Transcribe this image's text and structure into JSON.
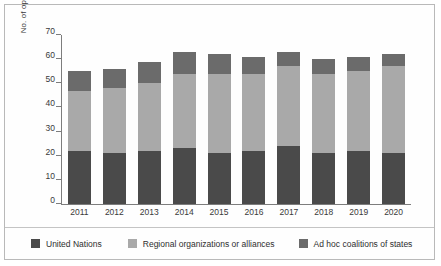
{
  "chart_data": {
    "type": "bar",
    "stacked": true,
    "title": "",
    "xlabel": "",
    "ylabel": "No. of operations",
    "ylim": [
      0,
      70
    ],
    "ytick_step": 10,
    "yticks": [
      0,
      10,
      20,
      30,
      40,
      50,
      60,
      70
    ],
    "grid": false,
    "legend_position": "bottom",
    "categories": [
      "2011",
      "2012",
      "2013",
      "2014",
      "2015",
      "2016",
      "2017",
      "2018",
      "2019",
      "2020"
    ],
    "series": [
      {
        "name": "United Nations",
        "color": "#4a4a4a",
        "values": [
          22,
          21,
          22,
          23,
          21,
          22,
          24,
          21,
          22,
          21
        ]
      },
      {
        "name": "Regional organizations or alliances",
        "color": "#a9a9a9",
        "values": [
          25,
          27,
          28,
          31,
          33,
          32,
          33,
          33,
          33,
          36
        ]
      },
      {
        "name": "Ad hoc coalitions of states",
        "color": "#6b6b6b",
        "values": [
          8,
          8,
          9,
          9,
          8,
          7,
          6,
          6,
          6,
          5
        ]
      }
    ],
    "totals": [
      55,
      56,
      59,
      63,
      62,
      61,
      63,
      60,
      61,
      62
    ]
  },
  "legend": {
    "items": [
      {
        "label": "United Nations",
        "swatch": "legend-swatch-united-nations"
      },
      {
        "label": "Regional organizations or alliances",
        "swatch": "legend-swatch-regional-organizations"
      },
      {
        "label": "Ad hoc coalitions of states",
        "swatch": "legend-swatch-ad-hoc-coalitions"
      }
    ]
  }
}
